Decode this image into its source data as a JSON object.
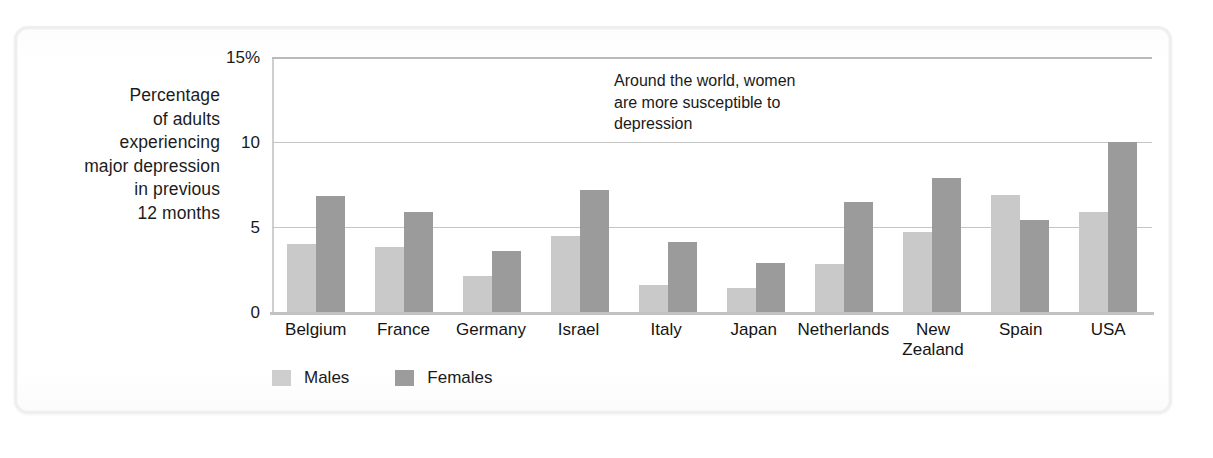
{
  "axis": {
    "y_title_lines": [
      "Percentage",
      "of adults",
      "experiencing",
      "major depression",
      "in previous",
      "12 months"
    ],
    "y_ticks": [
      "15%",
      "10",
      "5",
      "0"
    ]
  },
  "annotation": {
    "lines": [
      "Around the world, women",
      "are more susceptible to",
      "depression"
    ]
  },
  "legend": {
    "items": [
      {
        "label": "Males",
        "color": "#cecece"
      },
      {
        "label": "Females",
        "color": "#9c9c9c"
      }
    ]
  },
  "colors": {
    "males": "#c9c9c9",
    "females": "#9b9b9b",
    "gridline": "#c5c5c5",
    "text": "#1a1a1a"
  },
  "chart_data": {
    "type": "bar",
    "title": "",
    "subtitle": "",
    "annotation": "Around the world, women are more susceptible to depression",
    "xlabel": "",
    "ylabel": "Percentage of adults experiencing major depression in previous 12 months",
    "ylim": [
      0,
      15
    ],
    "yticks": [
      0,
      5,
      10,
      15
    ],
    "ytick_labels": [
      "0",
      "5",
      "10",
      "15%"
    ],
    "grid": true,
    "legend_position": "bottom-left",
    "categories": [
      "Belgium",
      "France",
      "Germany",
      "Israel",
      "Italy",
      "Japan",
      "Netherlands",
      "New Zealand",
      "Spain",
      "USA"
    ],
    "series": [
      {
        "name": "Males",
        "color": "#c9c9c9",
        "values": [
          4.0,
          3.8,
          2.1,
          4.5,
          1.6,
          1.4,
          2.8,
          4.7,
          6.9,
          5.9
        ]
      },
      {
        "name": "Females",
        "color": "#9b9b9b",
        "values": [
          6.8,
          5.9,
          3.6,
          7.2,
          4.1,
          2.9,
          6.5,
          7.9,
          5.4,
          10.0
        ]
      }
    ]
  }
}
